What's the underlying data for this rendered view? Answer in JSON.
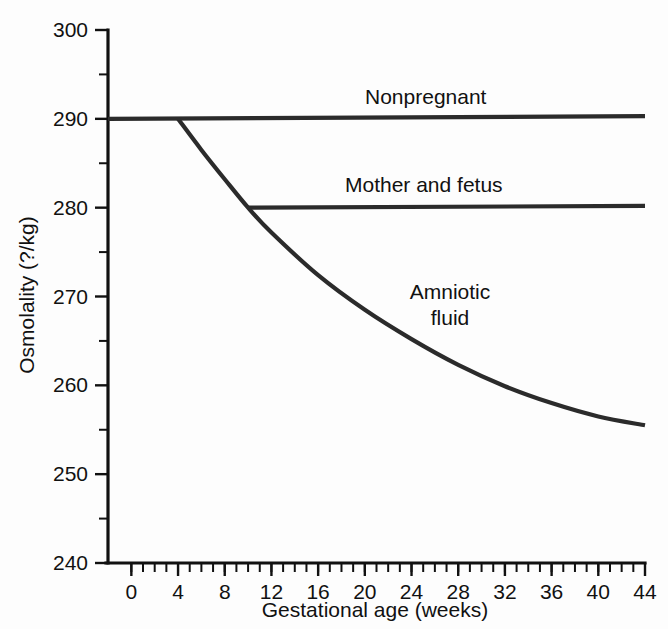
{
  "chart_data": {
    "type": "line",
    "title": "",
    "xlabel": "Gestational age (weeks)",
    "ylabel": "Osmolality (?/kg)",
    "xlim": [
      -2,
      44
    ],
    "ylim": [
      240,
      300
    ],
    "x_ticks": [
      0,
      4,
      8,
      12,
      16,
      20,
      24,
      28,
      32,
      36,
      40,
      44
    ],
    "x_tick_labels": [
      "0",
      "4",
      "8",
      "12",
      "16",
      "20",
      "24",
      "28",
      "32",
      "36",
      "40",
      "44"
    ],
    "x_minor_tick_step": 1,
    "y_ticks": [
      240,
      250,
      260,
      270,
      280,
      290,
      300
    ],
    "y_tick_labels": [
      "240",
      "250",
      "260",
      "270",
      "280",
      "290",
      "300"
    ],
    "y_minor_ticks": [
      245,
      255,
      265,
      275,
      285,
      295
    ],
    "grid": false,
    "legend_position": "inline-labels",
    "series": [
      {
        "name": "Nonpregnant",
        "label": "Nonpregnant",
        "color": "#2b2b2b",
        "x": [
          -2,
          44
        ],
        "values": [
          290,
          290.3
        ]
      },
      {
        "name": "Mother and fetus",
        "label": "Mother and fetus",
        "color": "#2b2b2b",
        "x": [
          10,
          44
        ],
        "values": [
          280,
          280.2
        ]
      },
      {
        "name": "Amniotic fluid",
        "label": "Amniotic fluid",
        "label_line1": "Amniotic",
        "label_line2": "fluid",
        "color": "#2b2b2b",
        "x": [
          4,
          6,
          8,
          10,
          12,
          16,
          20,
          24,
          28,
          32,
          36,
          40,
          44
        ],
        "values": [
          290,
          286.5,
          283.2,
          280,
          277.2,
          272.4,
          268.5,
          265.2,
          262.3,
          259.9,
          258.0,
          256.5,
          255.5
        ]
      }
    ],
    "annotations": [
      {
        "text": "Nonpregnant",
        "x": 20,
        "y": 292.2
      },
      {
        "text": "Mother and fetus",
        "x": 21,
        "y": 282.3
      },
      {
        "text": "Amniotic fluid",
        "x": 25,
        "y": 271.5
      }
    ]
  }
}
